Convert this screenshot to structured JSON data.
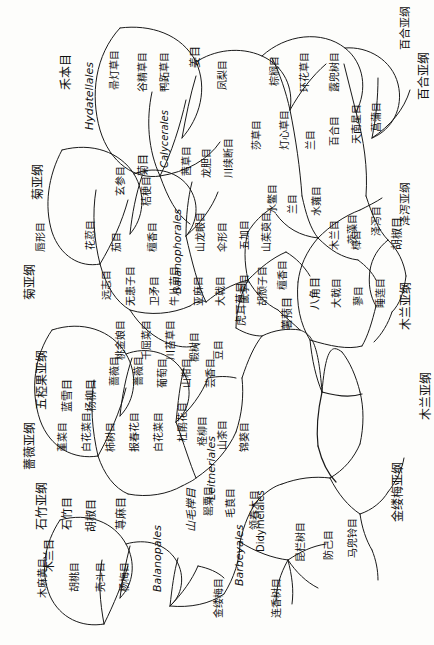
{
  "diagram": {
    "type": "phylogenetic-tree-cladogram",
    "orientation": "rotated-90-degrees",
    "background_color": "#fdfdfb",
    "line_color": "#1a1a1a",
    "subclasses": [
      {
        "id": "sc-juya",
        "label": "菊亚纲"
      },
      {
        "id": "sc-pohe",
        "label": "薔薇亚纲"
      },
      {
        "id": "sc-wuluan",
        "label": "五椏果亚纲"
      },
      {
        "id": "sc-shizhu",
        "label": "石竹亚纲"
      },
      {
        "id": "sc-jinlumei",
        "label": "金缕梅亚纲"
      },
      {
        "id": "sc-mulan",
        "label": "木兰亚纲"
      },
      {
        "id": "sc-baihe",
        "label": "百合亚纲"
      },
      {
        "id": "sc-qiangwei2",
        "label": "薔薇亚纲"
      }
    ],
    "orders": [
      {
        "label": "禾本目"
      },
      {
        "label": "Hydatellales",
        "latin": true
      },
      {
        "label": "帚灯草目"
      },
      {
        "label": "谷精草目"
      },
      {
        "label": "鸭跖草目"
      },
      {
        "label": "姜目"
      },
      {
        "label": "凤梨目"
      },
      {
        "label": "棕榈目"
      },
      {
        "label": "环花草目"
      },
      {
        "label": "露兜树目"
      },
      {
        "label": "天南星目"
      },
      {
        "label": "菖蒲目"
      },
      {
        "label": "百合目"
      },
      {
        "label": "兰目"
      },
      {
        "label": "灯心草目"
      },
      {
        "label": "莎草目"
      },
      {
        "label": "霉草目"
      },
      {
        "label": "水鳖目"
      },
      {
        "label": "茨藻目"
      },
      {
        "label": "泽泻目"
      },
      {
        "label": "泽泻亚纲"
      },
      {
        "label": "菊目"
      },
      {
        "label": "玄参目"
      },
      {
        "label": "桔梗目"
      },
      {
        "label": "Calycerales",
        "latin": true
      },
      {
        "label": "茜草目"
      },
      {
        "label": "龙胆目"
      },
      {
        "label": "川续断目"
      },
      {
        "label": "唇形目"
      },
      {
        "label": "花荵目"
      },
      {
        "label": "茄目"
      },
      {
        "label": "檀香目"
      },
      {
        "label": "Balanophorales",
        "latin": true
      },
      {
        "label": "山龙眼目"
      },
      {
        "label": "伞形目"
      },
      {
        "label": "五加目"
      },
      {
        "label": "山茱萸目"
      },
      {
        "label": "远志目"
      },
      {
        "label": "无患子目"
      },
      {
        "label": "卫矛目"
      },
      {
        "label": "牛儿苗目"
      },
      {
        "label": "亚麻目"
      },
      {
        "label": "大戟目"
      },
      {
        "label": "鼠李目"
      },
      {
        "label": "胡颓子目"
      },
      {
        "label": "桃金娘目"
      },
      {
        "label": "千屈菜目"
      },
      {
        "label": "虎耳草目"
      },
      {
        "label": "薔薇亚纲"
      },
      {
        "label": "薔薇目"
      },
      {
        "label": "豆目"
      },
      {
        "label": "蔷薇目"
      },
      {
        "label": "堇菜目"
      },
      {
        "label": "白花菜目"
      },
      {
        "label": "杜鹃花目"
      },
      {
        "label": "柿树目"
      },
      {
        "label": "报春花目"
      },
      {
        "label": "柽柳目"
      },
      {
        "label": "山茶目"
      },
      {
        "label": "锦葵目"
      },
      {
        "label": "荨麻目"
      },
      {
        "label": "胡桃目"
      },
      {
        "label": "杨梅目"
      },
      {
        "label": "壳斗目"
      },
      {
        "label": "木麻黄目"
      },
      {
        "label": "山毛榉目"
      },
      {
        "label": "Leitneriales",
        "latin": true
      },
      {
        "label": "Balanopales",
        "latin": true
      },
      {
        "label": "Barbeyales",
        "latin": true
      },
      {
        "label": "Didymelales",
        "latin": true
      },
      {
        "label": "金缕梅目"
      },
      {
        "label": "连香树目"
      },
      {
        "label": "昆栏树目"
      },
      {
        "label": "领春木目"
      },
      {
        "label": "毛茛目"
      },
      {
        "label": "罂粟目"
      },
      {
        "label": "防己目"
      },
      {
        "label": "马兜铃目"
      },
      {
        "label": "胡椒目"
      },
      {
        "label": "白花菜目"
      },
      {
        "label": "大花草目"
      },
      {
        "label": "八角目"
      },
      {
        "label": "樟目"
      },
      {
        "label": "睡莲目"
      },
      {
        "label": "木兰目"
      },
      {
        "label": "胡椒目"
      },
      {
        "label": "石竹目"
      },
      {
        "label": "蓼目"
      },
      {
        "label": "蓝雪目"
      },
      {
        "label": "杨柳目"
      },
      {
        "label": "椴树目"
      },
      {
        "label": "薯蓣目"
      },
      {
        "label": "薯蓣亚纲"
      },
      {
        "label": "兰目"
      },
      {
        "label": "夜莺目"
      },
      {
        "label": "水蕹目"
      },
      {
        "label": "葡萄目"
      },
      {
        "label": "山柑目"
      },
      {
        "label": "芸香目"
      },
      {
        "label": "檀香目"
      },
      {
        "label": "川苔草目"
      },
      {
        "label": "大戟目"
      },
      {
        "label": "马先蒿目"
      },
      {
        "label": "小檗目"
      },
      {
        "label": "荨麻目"
      }
    ]
  }
}
